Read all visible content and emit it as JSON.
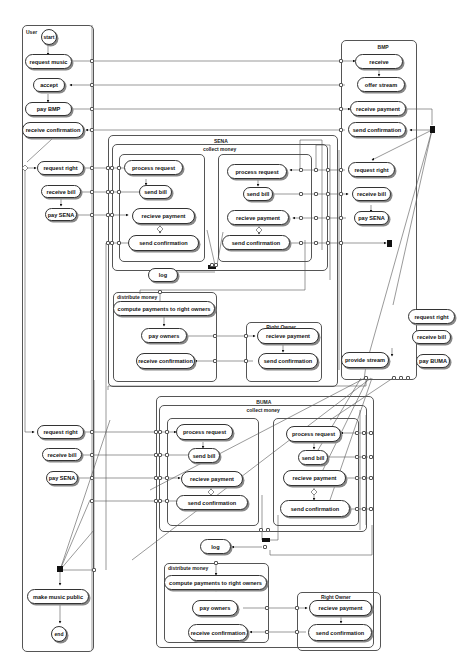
{
  "user": {
    "title": "User",
    "start": "start",
    "request_music": "request music",
    "accept": "accept",
    "pay_bmp": "pay BMP",
    "receive_confirmation": "receive confirmation",
    "request_right_1": "request right",
    "receive_bill_1": "receive bill",
    "pay_sena": "pay SENA",
    "request_right_2": "request right",
    "receive_bill_2": "receive bill",
    "pay_sena_2": "pay SENA",
    "make_music_public": "make music public",
    "end": "end"
  },
  "bmp": {
    "title": "BMP",
    "receive": "receive",
    "offer_stream": "offer stream",
    "receive_payment": "receive payment",
    "send_confirmation": "send confirmation",
    "request_right_sena": "request right",
    "receive_bill_sena": "receive bill",
    "pay_sena": "pay SENA",
    "request_right_buma": "request right",
    "receive_bill_buma": "receive bill",
    "pay_buma": "pay BUMA",
    "provide_stream": "provide stream"
  },
  "sena": {
    "title": "SENA",
    "collect_title": "collect money",
    "left": {
      "process_request": "process request",
      "send_bill": "send bill",
      "recieve_payment": "recieve payment",
      "send_confirmation": "send confirmation"
    },
    "right": {
      "process_request": "process request",
      "send_bill": "send bill",
      "recieve_payment": "recieve payment",
      "send_confirmation": "send confirmation"
    },
    "log": "log",
    "distribute_title": "distribute money",
    "compute": "compute payments to right owners",
    "pay_owners": "pay owners",
    "receive_confirmation": "receive confirmation",
    "owner_title": "Right Owner",
    "owner_recieve_payment": "recieve payment",
    "owner_send_confirmation": "send confirmation"
  },
  "buma": {
    "title": "BUMA",
    "collect_title": "collect money",
    "left": {
      "process_request": "process request",
      "send_bill": "send bill",
      "recieve_payment": "recieve payment",
      "send_confirmation": "send confirmation"
    },
    "right": {
      "process_request": "process request",
      "send_bill": "send bill",
      "recieve_payment": "recieve payment",
      "send_confirmation": "send confirmation"
    },
    "log": "log",
    "distribute_title": "distribute money",
    "compute": "compute payments to right owners",
    "pay_owners": "pay owners",
    "receive_confirmation": "receive confirmation",
    "owner_title": "Right Owner",
    "owner_recieve_payment": "recieve payment",
    "owner_send_confirmation": "send confirmation"
  }
}
